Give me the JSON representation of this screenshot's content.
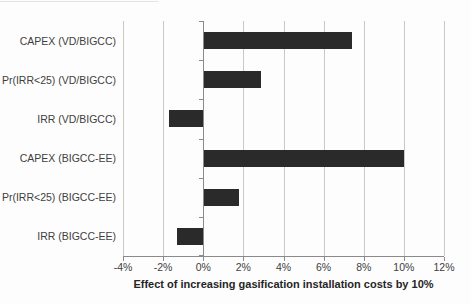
{
  "chart_data": {
    "type": "bar",
    "orientation": "horizontal",
    "categories": [
      "CAPEX (VD/BIGCC)",
      "Pr(IRR<25) (VD/BIGCC)",
      "IRR (VD/BIGCC)",
      "CAPEX (BIGCC-EE)",
      "Pr(IRR<25) (BIGCC-EE)",
      "IRR (BIGCC-EE)"
    ],
    "values": [
      7.4,
      2.9,
      -1.7,
      10.0,
      1.8,
      -1.3
    ],
    "title": "",
    "xlabel": "Effect of increasing gasification installation costs by 10%",
    "ylabel": "",
    "xlim": [
      -4,
      12
    ],
    "xticks": [
      -4,
      -2,
      0,
      2,
      4,
      6,
      8,
      10,
      12
    ],
    "xtick_labels": [
      "-4%",
      "-2%",
      "0%",
      "2%",
      "4%",
      "6%",
      "8%",
      "10%",
      "12%"
    ],
    "grid": "vertical-only",
    "legend": "none",
    "bar_color": "#2a2a2a",
    "gridline_color": "#c9c9c9",
    "axis_color": "#8a8a8a",
    "background_color": "#fdfdfd"
  }
}
